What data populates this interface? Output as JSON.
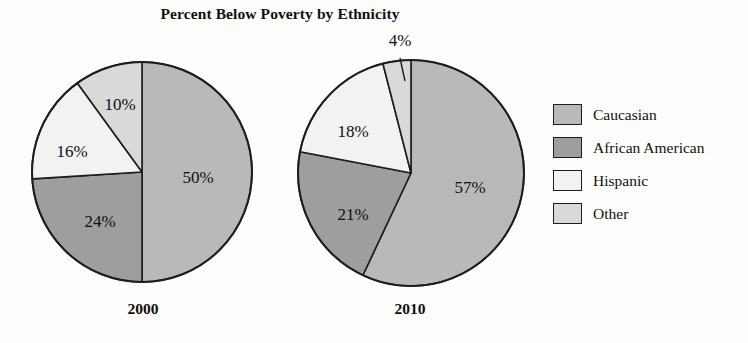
{
  "chart_data": {
    "type": "pie",
    "title": "Percent Below Poverty by Ethnicity",
    "xlabel": "",
    "ylabel": "",
    "legend_position": "right",
    "grid": false,
    "categories": [
      "Caucasian",
      "African American",
      "Hispanic",
      "Other"
    ],
    "colors": [
      "#b9b9b9",
      "#9e9e9e",
      "#f2f2f2",
      "#d9d9d9"
    ],
    "charts": [
      {
        "name": "2000",
        "caption": "2000",
        "labels": [
          "50%",
          "24%",
          "16%",
          "10%"
        ],
        "values": [
          50,
          24,
          16,
          10
        ]
      },
      {
        "name": "2010",
        "caption": "2010",
        "labels": [
          "57%",
          "21%",
          "18%",
          "4%"
        ],
        "values": [
          57,
          21,
          18,
          4
        ]
      }
    ]
  },
  "title": "Percent Below Poverty by Ethnicity",
  "pies": {
    "left": {
      "caption": "2000",
      "slices": [
        {
          "label": "50%",
          "value": 50,
          "category": "Caucasian"
        },
        {
          "label": "24%",
          "value": 24,
          "category": "African American"
        },
        {
          "label": "16%",
          "value": 16,
          "category": "Hispanic"
        },
        {
          "label": "10%",
          "value": 10,
          "category": "Other"
        }
      ]
    },
    "right": {
      "caption": "2010",
      "slices": [
        {
          "label": "57%",
          "value": 57,
          "category": "Caucasian"
        },
        {
          "label": "21%",
          "value": 21,
          "category": "African American"
        },
        {
          "label": "18%",
          "value": 18,
          "category": "Hispanic"
        },
        {
          "label": "4%",
          "value": 4,
          "category": "Other"
        }
      ]
    }
  },
  "legend": {
    "items": [
      {
        "label": "Caucasian",
        "color": "#b9b9b9"
      },
      {
        "label": "African American",
        "color": "#9e9e9e"
      },
      {
        "label": "Hispanic",
        "color": "#f2f2f2"
      },
      {
        "label": "Other",
        "color": "#d9d9d9"
      }
    ]
  }
}
